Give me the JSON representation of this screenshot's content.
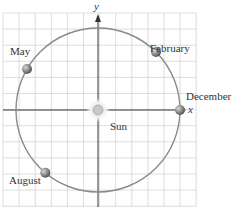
{
  "diagram": {
    "axes": {
      "x_label": "x",
      "y_label": "y"
    },
    "center": {
      "label": "Sun"
    },
    "orbit": {
      "positions": [
        {
          "label": "February",
          "angle_deg": 45
        },
        {
          "label": "May",
          "angle_deg": 150
        },
        {
          "label": "August",
          "angle_deg": 230
        },
        {
          "label": "December",
          "angle_deg": 0
        }
      ]
    },
    "colors": {
      "grid": "#d4d4d4",
      "axis": "#333333",
      "orbit": "#8a8a8a",
      "planet": "#7a7a7a",
      "sun": "#c8c8c8"
    }
  }
}
